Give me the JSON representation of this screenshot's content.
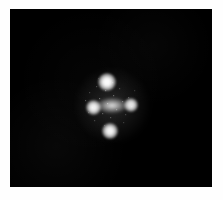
{
  "figure": {
    "width": 223,
    "height": 200,
    "background_color": "#fefefe",
    "plate": {
      "x": 10,
      "y": 9,
      "width": 202,
      "height": 178,
      "sky_color": "#000000"
    }
  },
  "chart_data": {
    "type": "scatter",
    "title": "",
    "subtitle": "",
    "xlabel": "",
    "ylabel": "",
    "grid": false,
    "legend_position": "none",
    "axis_units": "pixels",
    "xlim": [
      10,
      212
    ],
    "ylim": [
      9,
      187
    ],
    "background": "#000000",
    "source_color": "#ffffff",
    "series": [
      {
        "name": "Lensed quasar images",
        "marker": "point-source",
        "points": [
          {
            "label": "A",
            "position": "top",
            "x": 107,
            "y": 82,
            "radius": 9.0,
            "relative_brightness": 1.0
          },
          {
            "label": "B",
            "position": "left",
            "x": 93,
            "y": 107,
            "radius": 7.5,
            "relative_brightness": 0.88
          },
          {
            "label": "C",
            "position": "bottom",
            "x": 110,
            "y": 131,
            "radius": 8.0,
            "relative_brightness": 0.9
          },
          {
            "label": "D",
            "position": "right",
            "x": 131,
            "y": 105,
            "radius": 7.0,
            "relative_brightness": 0.74
          }
        ]
      },
      {
        "name": "Lensing galaxy",
        "marker": "extended-source",
        "points": [
          {
            "label": "G",
            "position": "center",
            "x": 112,
            "y": 105,
            "semi_major": 15,
            "semi_minor": 7.5,
            "relative_brightness": 0.55
          }
        ]
      }
    ],
    "annotations": []
  }
}
